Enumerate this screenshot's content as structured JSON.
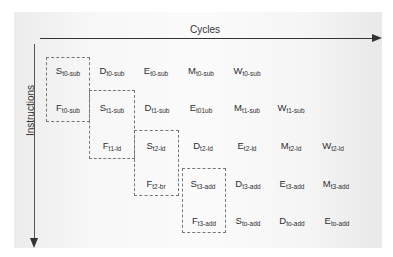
{
  "diagram": {
    "x_axis_label": "Cycles",
    "y_axis_label": "Instructions",
    "rows": [
      [
        {
          "stage": "S",
          "sub": "t0-sub"
        },
        {
          "stage": "D",
          "sub": "t0-sub"
        },
        {
          "stage": "E",
          "sub": "t0-sub"
        },
        {
          "stage": "M",
          "sub": "t0-sub"
        },
        {
          "stage": "W",
          "sub": "t0-sub"
        }
      ],
      [
        {
          "stage": "F",
          "sub": "t0-sub"
        },
        {
          "stage": "S",
          "sub": "t1-sub"
        },
        {
          "stage": "D",
          "sub": "t1-sub"
        },
        {
          "stage": "E",
          "sub": "t01ub"
        },
        {
          "stage": "M",
          "sub": "t1-sub"
        },
        {
          "stage": "W",
          "sub": "t1-sub"
        }
      ],
      [
        {
          "stage": "F",
          "sub": "t1-ld"
        },
        {
          "stage": "S",
          "sub": "t2-ld"
        },
        {
          "stage": "D",
          "sub": "t2-ld"
        },
        {
          "stage": "E",
          "sub": "t2-ld"
        },
        {
          "stage": "M",
          "sub": "t2-ld"
        },
        {
          "stage": "W",
          "sub": "t2-ld"
        }
      ],
      [
        {
          "stage": "F",
          "sub": "t2-br"
        },
        {
          "stage": "S",
          "sub": "t3-add"
        },
        {
          "stage": "D",
          "sub": "t3-add"
        },
        {
          "stage": "E",
          "sub": "t3-add"
        },
        {
          "stage": "M",
          "sub": "t3-add"
        }
      ],
      [
        {
          "stage": "F",
          "sub": "t3-add"
        },
        {
          "stage": "S",
          "sub": "to-add"
        },
        {
          "stage": "D",
          "sub": "to-add"
        },
        {
          "stage": "E",
          "sub": "to-add"
        }
      ]
    ]
  }
}
